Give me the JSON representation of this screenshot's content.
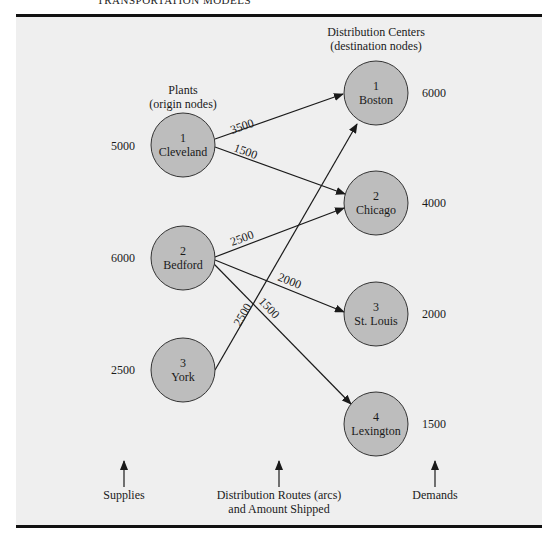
{
  "header": {
    "title": "TRANSPORTATION MODELS"
  },
  "headings": {
    "plants": "Plants",
    "plants_sub": "(origin nodes)",
    "centers": "Distribution Centers",
    "centers_sub": "(destination nodes)"
  },
  "origins": [
    {
      "id": "1",
      "name": "Cleveland",
      "supply": "5000"
    },
    {
      "id": "2",
      "name": "Bedford",
      "supply": "6000"
    },
    {
      "id": "3",
      "name": "York",
      "supply": "2500"
    }
  ],
  "destinations": [
    {
      "id": "1",
      "name": "Boston",
      "demand": "6000"
    },
    {
      "id": "2",
      "name": "Chicago",
      "demand": "4000"
    },
    {
      "id": "3",
      "name": "St. Louis",
      "demand": "2000"
    },
    {
      "id": "4",
      "name": "Lexington",
      "demand": "1500"
    }
  ],
  "arcs": [
    {
      "from": "Cleveland",
      "to": "Boston",
      "amount": "3500"
    },
    {
      "from": "Cleveland",
      "to": "Chicago",
      "amount": "1500"
    },
    {
      "from": "Bedford",
      "to": "Chicago",
      "amount": "2500"
    },
    {
      "from": "Bedford",
      "to": "St. Louis",
      "amount": "2000"
    },
    {
      "from": "Bedford",
      "to": "Lexington",
      "amount": "1500"
    },
    {
      "from": "York",
      "to": "Boston",
      "amount": "2500"
    }
  ],
  "footer": {
    "supplies": "Supplies",
    "routes_line1": "Distribution Routes (arcs)",
    "routes_line2": "and Amount Shipped",
    "demands": "Demands"
  },
  "colors": {
    "panel": "#efefef",
    "node_fill": "#bdbdbd",
    "ink": "#1a1a1a"
  }
}
